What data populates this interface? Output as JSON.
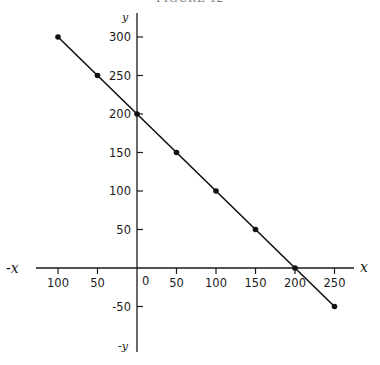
{
  "figure": {
    "caption": "FIGURE 12"
  },
  "chart_data": {
    "type": "line",
    "title": "",
    "xlabel": "x",
    "ylabel": "y",
    "neg_xlabel": "-x",
    "neg_ylabel": "-y",
    "origin_label": "0",
    "xlim": [
      -120,
      265
    ],
    "ylim": [
      -110,
      330
    ],
    "grid": false,
    "legend": null,
    "x_ticks": [
      -100,
      -50,
      50,
      100,
      150,
      200,
      250
    ],
    "x_tick_labels": [
      "100",
      "50",
      "50",
      "100",
      "150",
      "200",
      "250"
    ],
    "y_ticks": [
      300,
      250,
      200,
      150,
      100,
      50,
      -50
    ],
    "y_tick_labels": [
      "300",
      "250",
      "200",
      "150",
      "100",
      "50",
      "-50"
    ],
    "series": [
      {
        "name": "x + y = 200",
        "x": [
          -100,
          -50,
          0,
          50,
          100,
          150,
          200,
          250
        ],
        "y": [
          300,
          250,
          200,
          150,
          100,
          50,
          0,
          -50
        ],
        "markers": true,
        "color": "#111111"
      }
    ]
  }
}
